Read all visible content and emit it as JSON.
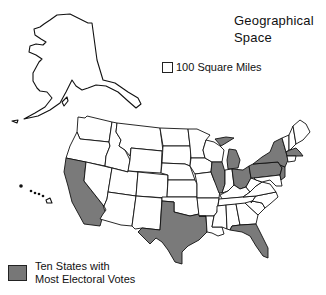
{
  "title": {
    "line1": "Geographical",
    "line2": "Space"
  },
  "scale": {
    "label": "100 Square Miles"
  },
  "legend": {
    "line1": "Ten States with",
    "line2": "Most Electoral Votes",
    "highlight_color": "#7a7a7a"
  },
  "highlighted_states": [
    "California",
    "Texas",
    "Florida",
    "Illinois",
    "Michigan",
    "Ohio",
    "Pennsylvania",
    "New York",
    "New Jersey",
    "Massachusetts"
  ]
}
